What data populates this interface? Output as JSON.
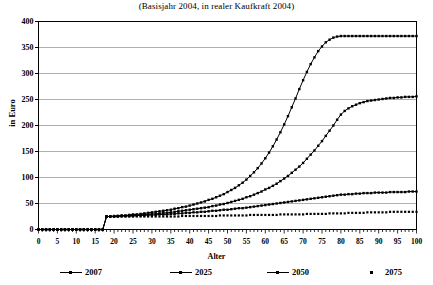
{
  "chart_data": {
    "type": "line",
    "title": "(Basisjahr 2004, in realer Kaufkraft 2004)",
    "xlabel": "Alter",
    "ylabel": "in Euro",
    "xlim": [
      0,
      100
    ],
    "ylim": [
      0,
      400
    ],
    "grid": "horizontal",
    "legend_position": "bottom",
    "xticks": [
      0,
      5,
      10,
      15,
      20,
      25,
      30,
      35,
      40,
      45,
      50,
      55,
      60,
      65,
      70,
      75,
      80,
      85,
      90,
      95,
      100
    ],
    "yticks": [
      0,
      50,
      100,
      150,
      200,
      250,
      300,
      350,
      400
    ],
    "x": [
      0,
      1,
      2,
      3,
      4,
      5,
      6,
      7,
      8,
      9,
      10,
      11,
      12,
      13,
      14,
      15,
      16,
      17,
      18,
      19,
      20,
      21,
      22,
      23,
      24,
      25,
      26,
      27,
      28,
      29,
      30,
      31,
      32,
      33,
      34,
      35,
      36,
      37,
      38,
      39,
      40,
      41,
      42,
      43,
      44,
      45,
      46,
      47,
      48,
      49,
      50,
      51,
      52,
      53,
      54,
      55,
      56,
      57,
      58,
      59,
      60,
      61,
      62,
      63,
      64,
      65,
      66,
      67,
      68,
      69,
      70,
      71,
      72,
      73,
      74,
      75,
      76,
      77,
      78,
      79,
      80,
      81,
      82,
      83,
      84,
      85,
      86,
      87,
      88,
      89,
      90,
      91,
      92,
      93,
      94,
      95,
      96,
      97,
      98,
      99,
      100
    ],
    "series": [
      {
        "name": "2007",
        "marker": "line-dot",
        "values": [
          0,
          0,
          0,
          0,
          0,
          0,
          0,
          0,
          0,
          0,
          0,
          0,
          0,
          0,
          0,
          0,
          0,
          0,
          25,
          25,
          26,
          26,
          27,
          27,
          28,
          29,
          29,
          30,
          31,
          32,
          33,
          34,
          35,
          36,
          37,
          38,
          40,
          41,
          43,
          44,
          46,
          48,
          50,
          52,
          54,
          57,
          59,
          62,
          65,
          68,
          72,
          76,
          80,
          85,
          90,
          96,
          103,
          110,
          118,
          127,
          137,
          148,
          160,
          173,
          187,
          202,
          218,
          235,
          252,
          270,
          287,
          303,
          318,
          331,
          343,
          352,
          360,
          365,
          369,
          371,
          372,
          372,
          372,
          372,
          372,
          372,
          372,
          372,
          372,
          372,
          372,
          372,
          372,
          372,
          372,
          372,
          372,
          372,
          372,
          372,
          372
        ]
      },
      {
        "name": "2025",
        "marker": "line-dot",
        "values": [
          0,
          0,
          0,
          0,
          0,
          0,
          0,
          0,
          0,
          0,
          0,
          0,
          0,
          0,
          0,
          0,
          0,
          0,
          25,
          25,
          25,
          26,
          26,
          26,
          27,
          27,
          28,
          28,
          29,
          29,
          30,
          30,
          31,
          32,
          32,
          33,
          34,
          35,
          36,
          37,
          38,
          39,
          40,
          41,
          42,
          43,
          45,
          46,
          48,
          49,
          51,
          53,
          55,
          57,
          59,
          62,
          64,
          67,
          70,
          73,
          77,
          80,
          84,
          88,
          93,
          98,
          103,
          109,
          115,
          121,
          128,
          136,
          144,
          152,
          161,
          170,
          180,
          190,
          200,
          211,
          221,
          228,
          233,
          237,
          240,
          243,
          245,
          247,
          248,
          249,
          250,
          251,
          252,
          253,
          253,
          254,
          254,
          255,
          255,
          255,
          256
        ]
      },
      {
        "name": "2050",
        "marker": "line-dot",
        "values": [
          0,
          0,
          0,
          0,
          0,
          0,
          0,
          0,
          0,
          0,
          0,
          0,
          0,
          0,
          0,
          0,
          0,
          0,
          25,
          25,
          25,
          25,
          26,
          26,
          26,
          26,
          27,
          27,
          27,
          28,
          28,
          28,
          29,
          29,
          29,
          30,
          30,
          31,
          31,
          32,
          32,
          33,
          33,
          34,
          34,
          35,
          36,
          36,
          37,
          38,
          38,
          39,
          40,
          41,
          41,
          42,
          43,
          44,
          45,
          46,
          47,
          48,
          49,
          50,
          51,
          52,
          53,
          54,
          55,
          56,
          57,
          58,
          59,
          60,
          61,
          62,
          63,
          64,
          65,
          66,
          67,
          67,
          68,
          68,
          69,
          69,
          70,
          70,
          70,
          71,
          71,
          71,
          71,
          72,
          72,
          72,
          72,
          72,
          73,
          73,
          73
        ]
      },
      {
        "name": "2075",
        "marker": "dot",
        "values": [
          0,
          0,
          0,
          0,
          0,
          0,
          0,
          0,
          0,
          0,
          0,
          0,
          0,
          0,
          0,
          0,
          0,
          0,
          25,
          25,
          25,
          25,
          25,
          25,
          25,
          25,
          25,
          25,
          25,
          25,
          25,
          25,
          25,
          25,
          25,
          25,
          25,
          25,
          26,
          26,
          26,
          26,
          26,
          26,
          26,
          26,
          26,
          26,
          27,
          27,
          27,
          27,
          27,
          27,
          27,
          27,
          28,
          28,
          28,
          28,
          28,
          28,
          28,
          28,
          29,
          29,
          29,
          29,
          29,
          29,
          29,
          30,
          30,
          30,
          30,
          30,
          30,
          31,
          31,
          31,
          31,
          31,
          32,
          32,
          32,
          32,
          32,
          33,
          33,
          33,
          33,
          33,
          33,
          34,
          34,
          34,
          34,
          34,
          34,
          34,
          34
        ]
      }
    ]
  },
  "legend": {
    "items": [
      {
        "label": "2007",
        "marker": "line-dot"
      },
      {
        "label": "2025",
        "marker": "line-dot"
      },
      {
        "label": "2050",
        "marker": "line-dot"
      },
      {
        "label": "2075",
        "marker": "dot"
      }
    ]
  }
}
